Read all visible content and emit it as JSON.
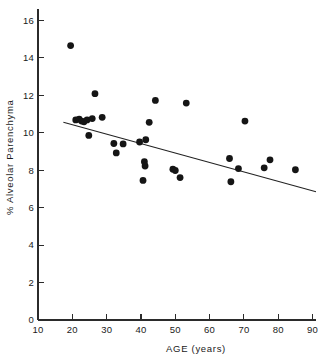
{
  "chart_data": {
    "type": "scatter",
    "title": "",
    "xlabel": "AGE   (years)",
    "ylabel": "% Alveolar  Parenchyma",
    "xlim": [
      10,
      91
    ],
    "ylim": [
      0,
      16.6
    ],
    "xticks": [
      10,
      20,
      30,
      40,
      50,
      60,
      70,
      80,
      90
    ],
    "yticks": [
      0,
      2,
      4,
      6,
      8,
      10,
      12,
      14,
      16
    ],
    "xtick_labels": [
      "10",
      "20",
      "30",
      "40",
      "50",
      "60",
      "70",
      "80",
      "90"
    ],
    "ytick_labels": [
      "0",
      "2",
      "4",
      "6",
      "8",
      "10",
      "12",
      "14",
      "16"
    ],
    "grid": false,
    "legend": null,
    "marker": "filled-circle",
    "marker_color": "#151515",
    "marker_size_px": 3.4,
    "points": [
      {
        "x": 19.5,
        "y": 14.65
      },
      {
        "x": 21.0,
        "y": 10.68
      },
      {
        "x": 22.0,
        "y": 10.72
      },
      {
        "x": 22.7,
        "y": 10.62
      },
      {
        "x": 23.4,
        "y": 10.58
      },
      {
        "x": 24.3,
        "y": 10.68
      },
      {
        "x": 24.8,
        "y": 9.85
      },
      {
        "x": 25.8,
        "y": 10.75
      },
      {
        "x": 26.6,
        "y": 12.08
      },
      {
        "x": 28.7,
        "y": 10.82
      },
      {
        "x": 32.1,
        "y": 9.42
      },
      {
        "x": 32.8,
        "y": 8.92
      },
      {
        "x": 34.8,
        "y": 9.4
      },
      {
        "x": 39.6,
        "y": 9.5
      },
      {
        "x": 40.6,
        "y": 7.45
      },
      {
        "x": 41.0,
        "y": 8.45
      },
      {
        "x": 41.2,
        "y": 8.22
      },
      {
        "x": 41.4,
        "y": 9.62
      },
      {
        "x": 42.4,
        "y": 10.55
      },
      {
        "x": 44.2,
        "y": 11.72
      },
      {
        "x": 49.3,
        "y": 8.05
      },
      {
        "x": 50.0,
        "y": 7.98
      },
      {
        "x": 51.4,
        "y": 7.6
      },
      {
        "x": 53.2,
        "y": 11.58
      },
      {
        "x": 65.8,
        "y": 8.62
      },
      {
        "x": 66.2,
        "y": 7.38
      },
      {
        "x": 68.4,
        "y": 8.08
      },
      {
        "x": 70.3,
        "y": 10.62
      },
      {
        "x": 75.9,
        "y": 8.12
      },
      {
        "x": 77.6,
        "y": 8.55
      },
      {
        "x": 85.0,
        "y": 8.02
      }
    ],
    "fit_line": {
      "label": "regression-line",
      "x_start": 17.4,
      "y_start": 10.55,
      "x_end": 91.0,
      "y_end": 6.85
    }
  }
}
